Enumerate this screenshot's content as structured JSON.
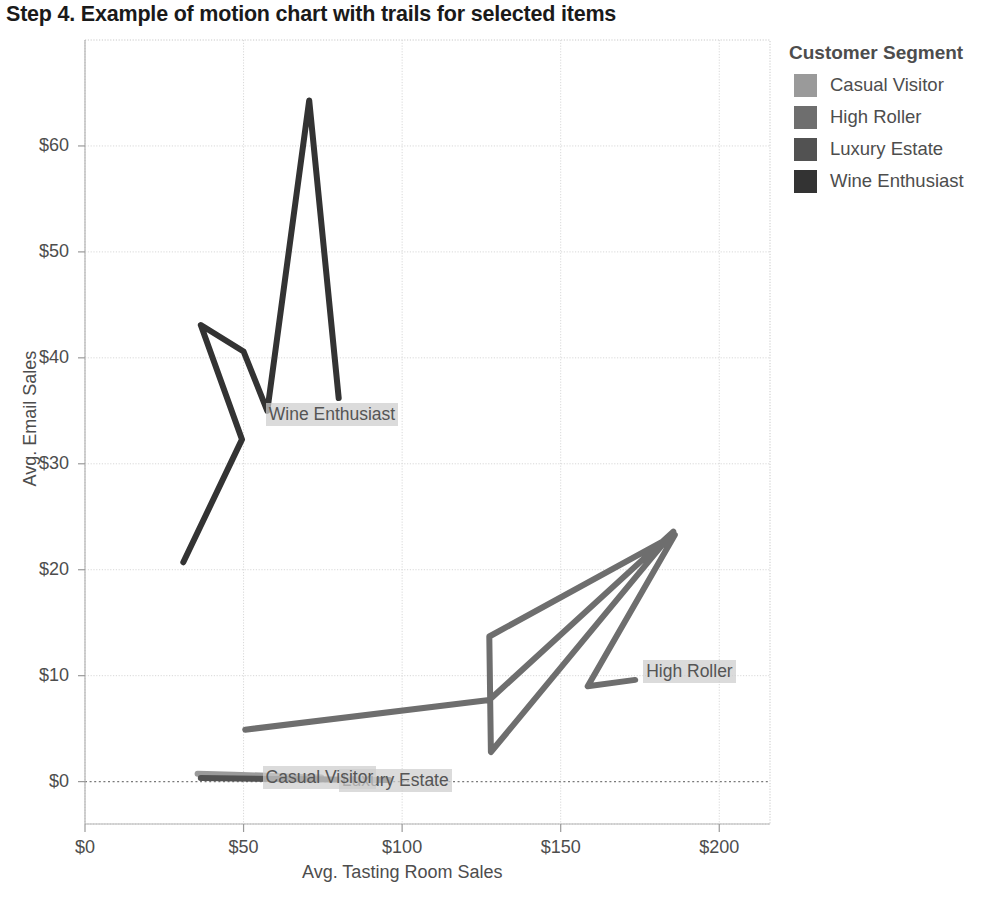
{
  "title": "Step 4.  Example of motion chart with trails for selected items",
  "legend": {
    "title": "Customer Segment",
    "items": [
      {
        "label": "Casual Visitor",
        "color": "#9a9a9a"
      },
      {
        "label": "High Roller",
        "color": "#6e6e6e"
      },
      {
        "label": "Luxury Estate",
        "color": "#525252"
      },
      {
        "label": "Wine Enthusiast",
        "color": "#333333"
      }
    ]
  },
  "chart_data": {
    "type": "line",
    "title": "Step 4.  Example of motion chart with trails for selected items",
    "xlabel": "Avg. Tasting Room Sales",
    "ylabel": "Avg. Email Sales",
    "xlim": [
      0,
      216
    ],
    "ylim": [
      -4,
      70
    ],
    "xticks": [
      0,
      50,
      100,
      150,
      200
    ],
    "xticklabels": [
      "$0",
      "$50",
      "$100",
      "$150",
      "$200"
    ],
    "yticks": [
      0,
      10,
      20,
      30,
      40,
      50,
      60
    ],
    "yticklabels": [
      "$0",
      "$10",
      "$20",
      "$30",
      "$40",
      "$50",
      "$60"
    ],
    "grid": true,
    "zero_line": true,
    "legend_position": "right",
    "series": [
      {
        "name": "Casual Visitor",
        "color": "#9a9a9a",
        "label_text": "Casual Visitor",
        "label_x": 56,
        "label_y": 0.3,
        "points": [
          {
            "x": 35.5,
            "y": 0.75
          },
          {
            "x": 47.0,
            "y": 0.65
          },
          {
            "x": 57.5,
            "y": 0.55
          },
          {
            "x": 68.0,
            "y": 0.45
          },
          {
            "x": 74.5,
            "y": 0.4
          }
        ]
      },
      {
        "name": "Luxury Estate",
        "color": "#525252",
        "label_text": "Luxury Estate",
        "label_x": 80,
        "label_y": 0.1,
        "points": [
          {
            "x": 36.5,
            "y": 0.35
          },
          {
            "x": 48.0,
            "y": 0.3
          },
          {
            "x": 60.0,
            "y": 0.25
          },
          {
            "x": 72.0,
            "y": 0.22
          },
          {
            "x": 84.0,
            "y": 0.18
          },
          {
            "x": 96.0,
            "y": 0.15
          }
        ]
      },
      {
        "name": "High Roller",
        "color": "#6e6e6e",
        "label_text": "High Roller",
        "label_x": 176,
        "label_y": 10.3,
        "points": [
          {
            "x": 50.5,
            "y": 4.9
          },
          {
            "x": 127.5,
            "y": 7.7
          },
          {
            "x": 185.5,
            "y": 23.6
          },
          {
            "x": 128.0,
            "y": 2.8
          },
          {
            "x": 127.5,
            "y": 13.7
          },
          {
            "x": 186.0,
            "y": 23.3
          },
          {
            "x": 158.5,
            "y": 9.0
          },
          {
            "x": 173.5,
            "y": 9.6
          }
        ]
      },
      {
        "name": "Wine Enthusiast",
        "color": "#333333",
        "label_text": "Wine Enthusiast",
        "label_x": 57,
        "label_y": 34.6,
        "points": [
          {
            "x": 31.0,
            "y": 20.7
          },
          {
            "x": 49.5,
            "y": 32.3
          },
          {
            "x": 36.5,
            "y": 43.1
          },
          {
            "x": 50.0,
            "y": 40.6
          },
          {
            "x": 57.5,
            "y": 35.0
          },
          {
            "x": 70.7,
            "y": 64.3
          },
          {
            "x": 80.0,
            "y": 36.2
          }
        ]
      }
    ]
  }
}
